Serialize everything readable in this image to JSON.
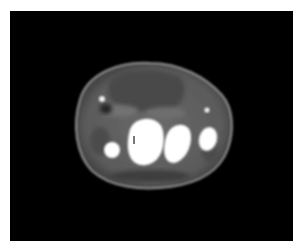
{
  "image": {
    "kind": "axial CT slice",
    "description": "Cross-sectional CT image of a limb showing soft tissue, a large hypodense mass region at the top, and several bright bone structures",
    "background_color": "#000000",
    "frame_color": "#ffffff"
  }
}
